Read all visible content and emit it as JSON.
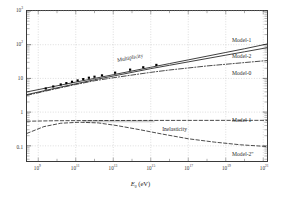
{
  "figure": {
    "background": "#ffffff",
    "frame_color": "#3a3a3a",
    "grid_color": "#b9b9b9"
  },
  "axis": {
    "xlabel_symbol": "E",
    "xlabel_sub": "0",
    "xlabel_unit": "(eV)",
    "xticks": [
      {
        "mantissa": "10",
        "exp": "9",
        "value": 9
      },
      {
        "mantissa": "10",
        "exp": "11",
        "value": 11
      },
      {
        "mantissa": "10",
        "exp": "13",
        "value": 13
      },
      {
        "mantissa": "10",
        "exp": "15",
        "value": 15
      },
      {
        "mantissa": "10",
        "exp": "17",
        "value": 17
      },
      {
        "mantissa": "10",
        "exp": "19",
        "value": 19
      },
      {
        "mantissa": "10",
        "exp": "21",
        "value": 21
      }
    ],
    "yticks": [
      {
        "text": "10",
        "exp": "3",
        "value": 3
      },
      {
        "text": "10",
        "exp": "2",
        "value": 2
      },
      {
        "text": "10",
        "exp": "",
        "value": 1
      },
      {
        "text": "1",
        "exp": "",
        "value": 0
      },
      {
        "text": "0.1",
        "exp": "",
        "value": -1
      }
    ]
  },
  "annotations": {
    "multiplicity": "Multiplicity",
    "inelasticity": "Inelasticity",
    "model1_mult": "Model-1",
    "model2_mult": "Model-2",
    "model0_mult": "Model-0",
    "model1_inel": "Model-1",
    "model2_inel": "Model-2\""
  },
  "chart_data": {
    "type": "line",
    "title": "",
    "xlabel": "E0 (eV)",
    "ylabel": "",
    "xscale": "log",
    "yscale": "log",
    "xlim": [
      8.4,
      21.2
    ],
    "ylim": [
      -1.45,
      3.0
    ],
    "grid": true,
    "legend": "inline-right-annotations",
    "series": [
      {
        "name": "Multiplicity Model-1",
        "style": "solid",
        "color": "#1b1b1b",
        "x": [
          8.4,
          10,
          11,
          12,
          13,
          14,
          15,
          16,
          17,
          18,
          19,
          20,
          21.2
        ],
        "y": [
          0.6,
          0.78,
          0.89,
          1.0,
          1.11,
          1.22,
          1.33,
          1.44,
          1.55,
          1.66,
          1.77,
          1.88,
          2.02
        ]
      },
      {
        "name": "Multiplicity Model-2",
        "style": "solid",
        "color": "#1b1b1b",
        "x": [
          8.4,
          10,
          11,
          12,
          13,
          14,
          15,
          16,
          17,
          18,
          19,
          20,
          21.2
        ],
        "y": [
          0.52,
          0.72,
          0.84,
          0.96,
          1.07,
          1.18,
          1.29,
          1.39,
          1.49,
          1.59,
          1.69,
          1.79,
          1.91
        ]
      },
      {
        "name": "Multiplicity Model-0",
        "style": "dash-dot",
        "color": "#2a2a2a",
        "x": [
          8.4,
          10,
          11,
          12,
          13,
          14,
          15,
          16,
          17,
          18,
          19,
          20,
          21.2
        ],
        "y": [
          0.5,
          0.7,
          0.82,
          0.93,
          1.02,
          1.1,
          1.18,
          1.25,
          1.31,
          1.37,
          1.42,
          1.47,
          1.53
        ]
      },
      {
        "name": "Inelasticity Model-1",
        "style": "dashed",
        "color": "#2a2a2a",
        "x": [
          8.4,
          10,
          12,
          14,
          16,
          18,
          20,
          21.2
        ],
        "y": [
          -0.27,
          -0.255,
          -0.25,
          -0.248,
          -0.246,
          -0.245,
          -0.244,
          -0.244
        ]
      },
      {
        "name": "Inelasticity Model-2",
        "style": "dashed",
        "color": "#2a2a2a",
        "x": [
          8.4,
          9.3,
          10.2,
          11.2,
          12.2,
          13.2,
          14.4,
          15.6,
          17,
          18.4,
          19.8,
          21.2
        ],
        "y": [
          -0.63,
          -0.43,
          -0.33,
          -0.3,
          -0.32,
          -0.4,
          -0.52,
          -0.65,
          -0.79,
          -0.89,
          -0.97,
          -1.02
        ]
      }
    ],
    "markers": {
      "name": "Measured multiplicity data",
      "shape": "square",
      "color": "#000000",
      "points": [
        {
          "x": 9.4,
          "y": 0.7
        },
        {
          "x": 9.8,
          "y": 0.76
        },
        {
          "x": 10.2,
          "y": 0.82
        },
        {
          "x": 10.5,
          "y": 0.86
        },
        {
          "x": 10.8,
          "y": 0.9
        },
        {
          "x": 11.1,
          "y": 0.94
        },
        {
          "x": 11.4,
          "y": 0.98
        },
        {
          "x": 11.7,
          "y": 1.02
        },
        {
          "x": 12.0,
          "y": 1.05
        },
        {
          "x": 12.4,
          "y": 1.09
        },
        {
          "x": 13.1,
          "y": 1.17
        },
        {
          "x": 13.9,
          "y": 1.26
        },
        {
          "x": 14.6,
          "y": 1.33
        },
        {
          "x": 15.3,
          "y": 1.4
        }
      ]
    },
    "band": {
      "name": "Inelasticity uncertainty band",
      "color": "#c9c9c9",
      "x_range": [
        11.4,
        15.2
      ],
      "y_center": -0.27,
      "y_halfwidth": 0.035
    }
  }
}
